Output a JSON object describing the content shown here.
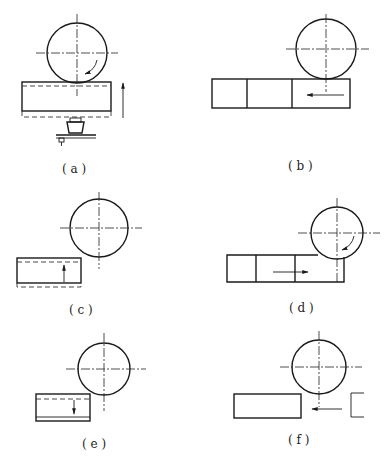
{
  "figure": {
    "panels": [
      {
        "id": "a",
        "label": "( a )"
      },
      {
        "id": "b",
        "label": "( b )"
      },
      {
        "id": "c",
        "label": "( c )"
      },
      {
        "id": "d",
        "label": "( d )"
      },
      {
        "id": "e",
        "label": "( e )"
      },
      {
        "id": "f",
        "label": "( f )"
      }
    ]
  }
}
